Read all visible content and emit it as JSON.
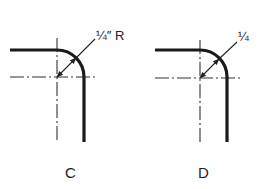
{
  "figures": [
    {
      "id": "C",
      "label": "C",
      "dimension_text": "1/4″ R",
      "dimension_display": "¼″ R"
    },
    {
      "id": "D",
      "label": "D",
      "dimension_text": "1/4",
      "dimension_display": "¼"
    }
  ],
  "colors": {
    "line": "#1a1a1a",
    "background": "#ffffff"
  }
}
